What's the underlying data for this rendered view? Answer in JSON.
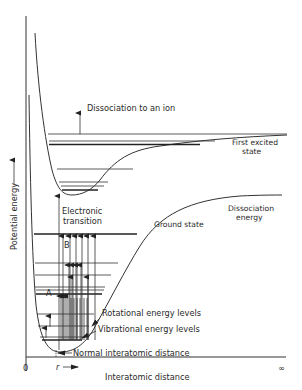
{
  "diagram": {
    "axes": {
      "y_label": "Potential energy",
      "x_label": "Interatomic distance",
      "origin_label": "0",
      "x_end_label": "∞",
      "r_label": "r"
    },
    "curves": {
      "excited": {
        "label_line1": "First excited",
        "label_line2": "state"
      },
      "ground": {
        "label": "Ground state"
      }
    },
    "annotations": {
      "dissociation_ion": "Dissociation to an ion",
      "dissociation_energy_line1": "Dissociation",
      "dissociation_energy_line2": "energy",
      "electronic_line1": "Electronic",
      "electronic_line2": "transition",
      "rotational": "Rotational energy levels",
      "vibrational": "Vibrational energy levels",
      "normal_distance": "Normal interatomic distance",
      "label_a": "A",
      "label_b": "B"
    }
  }
}
